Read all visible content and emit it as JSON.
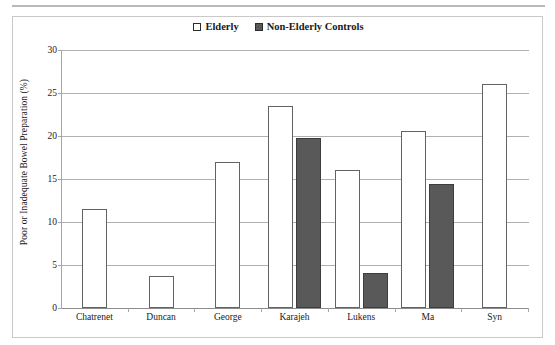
{
  "chart_data": {
    "type": "bar",
    "title": "",
    "xlabel": "",
    "ylabel": "Poor or Inadequate Bowel Preparation (%)",
    "ylim": [
      0,
      30
    ],
    "yticks": [
      0,
      5,
      10,
      15,
      20,
      25,
      30
    ],
    "ytick_labels": [
      "0",
      "5",
      "10",
      "15",
      "20",
      "25",
      "30"
    ],
    "grid": true,
    "legend_position": "top-center",
    "categories": [
      "Chatrenet",
      "Duncan",
      "George",
      "Karajeh",
      "Lukens",
      "Ma",
      "Syn"
    ],
    "series": [
      {
        "name": "Elderly",
        "color": "#ffffff",
        "edge_color": "#636363",
        "values": [
          11.5,
          3.7,
          17.0,
          23.5,
          16.1,
          20.6,
          26.0
        ]
      },
      {
        "name": "Non-Elderly Controls",
        "color": "#595959",
        "edge_color": "#3d3d3d",
        "values": [
          null,
          null,
          null,
          19.8,
          4.1,
          14.4,
          null
        ]
      }
    ]
  },
  "legend": {
    "entries": [
      {
        "label": "Elderly",
        "swatch": "open-square"
      },
      {
        "label": "Non-Elderly Controls",
        "swatch": "filled-square"
      }
    ]
  },
  "axes": {
    "y_title": "Poor or Inadequate Bowel Preparation (%)"
  }
}
